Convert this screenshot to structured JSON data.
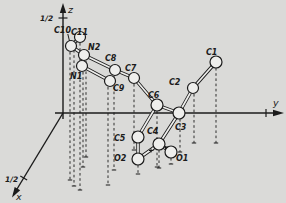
{
  "figure": {
    "colors": {
      "background": "#dadad8",
      "ink": "#1b1b1b",
      "fill": "#eeeeec"
    },
    "axes": {
      "z": {
        "label": "z",
        "tick_label": "1/2"
      },
      "y": {
        "label": "y"
      },
      "x": {
        "label": "x",
        "tick_label": "1/2"
      }
    },
    "atoms": [
      {
        "id": "C1",
        "label": "C1",
        "x": 216,
        "y": 62,
        "r": 6,
        "lx": 206,
        "ly": 55
      },
      {
        "id": "C2",
        "label": "C2",
        "x": 193,
        "y": 88,
        "r": 5.5,
        "lx": 169,
        "ly": 85
      },
      {
        "id": "C3",
        "label": "C3",
        "x": 179,
        "y": 113,
        "r": 6,
        "lx": 175,
        "ly": 130
      },
      {
        "id": "C4",
        "label": "C4",
        "x": 159,
        "y": 144,
        "r": 6,
        "lx": 147,
        "ly": 134
      },
      {
        "id": "C5",
        "label": "C5",
        "x": 138,
        "y": 137,
        "r": 6,
        "lx": 114,
        "ly": 141
      },
      {
        "id": "C6",
        "label": "C6",
        "x": 157,
        "y": 105,
        "r": 6,
        "lx": 148,
        "ly": 98
      },
      {
        "id": "C7",
        "label": "C7",
        "x": 134,
        "y": 78,
        "r": 5.5,
        "lx": 125,
        "ly": 71
      },
      {
        "id": "C8",
        "label": "C8",
        "x": 115,
        "y": 70,
        "r": 5.5,
        "lx": 105,
        "ly": 61
      },
      {
        "id": "C9",
        "label": "C9",
        "x": 110,
        "y": 81,
        "r": 5.5,
        "lx": 113,
        "ly": 91
      },
      {
        "id": "C10",
        "label": "C10",
        "x": 71,
        "y": 46,
        "r": 5.5,
        "lx": 54,
        "ly": 33
      },
      {
        "id": "C11",
        "label": "C11",
        "x": 80,
        "y": 37,
        "r": 5.5,
        "lx": 71,
        "ly": 35
      },
      {
        "id": "N1",
        "label": "N1",
        "x": 82,
        "y": 66,
        "r": 5.5,
        "lx": 70,
        "ly": 79
      },
      {
        "id": "N2",
        "label": "N2",
        "x": 84,
        "y": 55,
        "r": 5.5,
        "lx": 88,
        "ly": 50
      },
      {
        "id": "O1",
        "label": "O1",
        "x": 171,
        "y": 152,
        "r": 6,
        "lx": 176,
        "ly": 161
      },
      {
        "id": "O2",
        "label": "O2",
        "x": 138,
        "y": 159,
        "r": 6,
        "lx": 114,
        "ly": 161
      }
    ],
    "bonds": [
      [
        "C1",
        "C2"
      ],
      [
        "C2",
        "C3"
      ],
      [
        "C3",
        "C6"
      ],
      [
        "C3",
        "C4"
      ],
      [
        "C4",
        "O1"
      ],
      [
        "C4",
        "O2"
      ],
      [
        "C5",
        "O2"
      ],
      [
        "C5",
        "C6"
      ],
      [
        "C6",
        "C7"
      ],
      [
        "C7",
        "C8"
      ],
      [
        "N2",
        "C8"
      ],
      [
        "N1",
        "C9"
      ],
      [
        "N1",
        "N2"
      ],
      [
        "C10",
        "N2"
      ],
      [
        "C10",
        "C11"
      ]
    ],
    "drop_lines": [
      {
        "x": 70,
        "y1": 52,
        "y2": 180
      },
      {
        "x": 74,
        "y1": 50,
        "y2": 186
      },
      {
        "x": 80,
        "y1": 43,
        "y2": 190
      },
      {
        "x": 83,
        "y1": 72,
        "y2": 167
      },
      {
        "x": 86,
        "y1": 61,
        "y2": 157
      },
      {
        "x": 108,
        "y1": 87,
        "y2": 185
      },
      {
        "x": 114,
        "y1": 76,
        "y2": 170
      },
      {
        "x": 134,
        "y1": 84,
        "y2": 150
      },
      {
        "x": 157,
        "y1": 111,
        "y2": 167
      },
      {
        "x": 138,
        "y1": 165,
        "y2": 174
      },
      {
        "x": 159,
        "y1": 150,
        "y2": 168
      },
      {
        "x": 171,
        "y1": 158,
        "y2": 164
      },
      {
        "x": 180,
        "y1": 119,
        "y2": 152
      },
      {
        "x": 194,
        "y1": 94,
        "y2": 143
      },
      {
        "x": 216,
        "y1": 68,
        "y2": 143
      }
    ]
  }
}
